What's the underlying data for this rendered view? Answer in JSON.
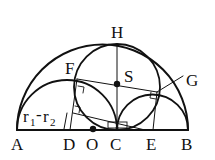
{
  "diagram": {
    "stroke_color": "#111111",
    "points": {
      "A": {
        "label": "A"
      },
      "B": {
        "label": "B"
      },
      "C": {
        "label": "C"
      },
      "D": {
        "label": "D"
      },
      "E": {
        "label": "E"
      },
      "F": {
        "label": "F"
      },
      "G": {
        "label": "G"
      },
      "H": {
        "label": "H"
      },
      "O": {
        "label": "O"
      },
      "S": {
        "label": "S"
      }
    },
    "annotation": {
      "r1": "r",
      "r1_sub": "1",
      "minus": "-",
      "r2": "r",
      "r2_sub": "2"
    }
  }
}
